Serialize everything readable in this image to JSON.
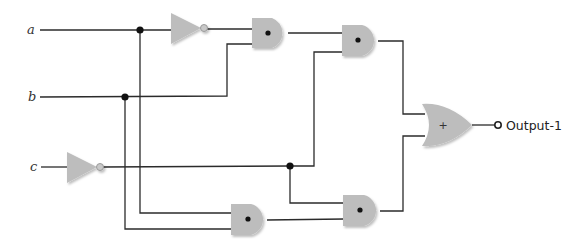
{
  "diagram": {
    "type": "logic-circuit",
    "inputs": [
      {
        "id": "a",
        "label": "a"
      },
      {
        "id": "b",
        "label": "b"
      },
      {
        "id": "c",
        "label": "c"
      }
    ],
    "output": {
      "id": "output-1",
      "label": "Output-1"
    },
    "gates": [
      {
        "id": "not1",
        "type": "NOT",
        "input": "a"
      },
      {
        "id": "not2",
        "type": "NOT",
        "input": "c"
      },
      {
        "id": "and1",
        "type": "AND",
        "symbol": "•",
        "inputs": [
          "not1",
          "b"
        ]
      },
      {
        "id": "and2",
        "type": "AND",
        "symbol": "•",
        "inputs": [
          "and1",
          "not2"
        ]
      },
      {
        "id": "and3",
        "type": "AND",
        "symbol": "•",
        "inputs": [
          "a",
          "b"
        ]
      },
      {
        "id": "and4",
        "type": "AND",
        "symbol": "•",
        "inputs": [
          "not2",
          "and3"
        ]
      },
      {
        "id": "or1",
        "type": "OR",
        "symbol": "+",
        "inputs": [
          "and2",
          "and4"
        ]
      }
    ],
    "or_symbol": "+",
    "colors": {
      "gate_fill": "#bdbdbd",
      "wire": "#2b2b2b",
      "junction": "#111111",
      "background": "#ffffff"
    }
  }
}
